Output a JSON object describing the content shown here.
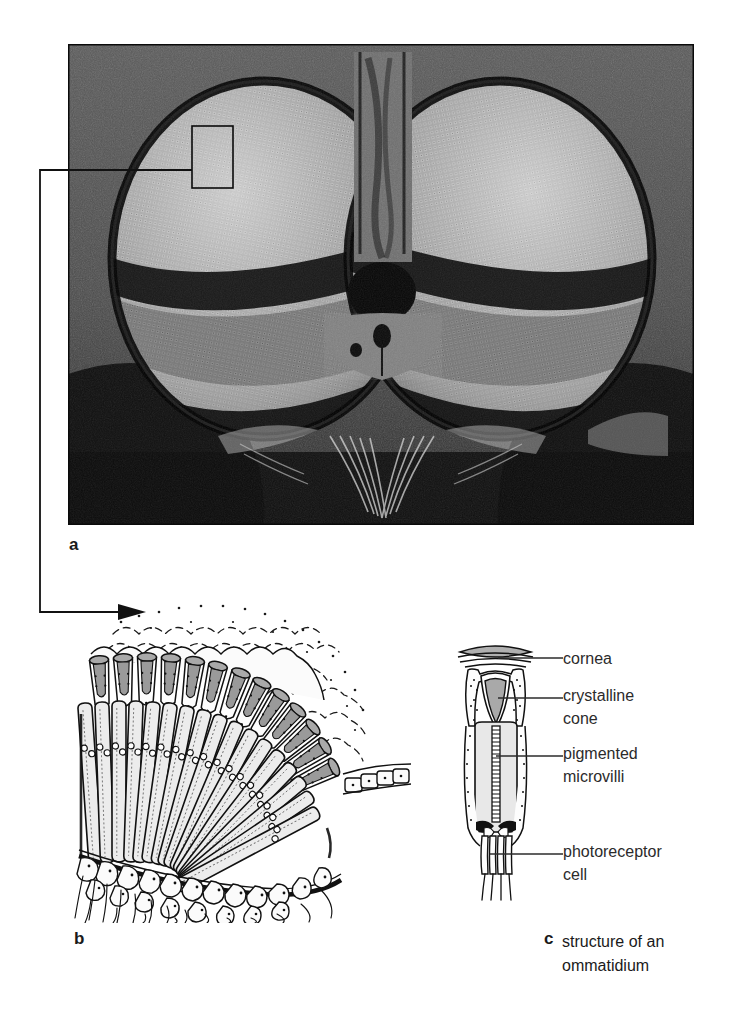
{
  "figure": {
    "panels": {
      "a": {
        "letter": "a",
        "caption": "",
        "image_kind": "scanning-electron-micrograph",
        "subject": "frontal view of a fly head showing the two compound eyes",
        "callout": "rectangle on the left compound eye linked by a line to panel b"
      },
      "b": {
        "letter": "b",
        "caption": "",
        "image_kind": "line-drawing",
        "subject": "cut-away array of ommatidia through the curved eye"
      },
      "c": {
        "letter": "c",
        "caption": "structure of an\nommatidium",
        "caption_line1": "structure of an",
        "caption_line2": "ommatidium",
        "image_kind": "line-drawing",
        "subject": "single ommatidium in longitudinal section"
      }
    },
    "labels": [
      {
        "id": "cornea",
        "text": "cornea"
      },
      {
        "id": "crystalline",
        "text": "crystalline\ncone"
      },
      {
        "id": "pigmented",
        "text": "pigmented\nmicrovilli"
      },
      {
        "id": "photoreceptor",
        "text": "photoreceptor\ncell"
      }
    ],
    "colors": {
      "background": "#ffffff",
      "ink": "#1a1a1a",
      "label_ink": "#2b2b2b",
      "photo_background": "#4b4b4b",
      "photo_dark": "#0d0d0d",
      "eye_midtone": "#8a8a8a",
      "cone_fill": "#a8a8a8",
      "rhabdom_fill": "#e2e2e2"
    }
  }
}
